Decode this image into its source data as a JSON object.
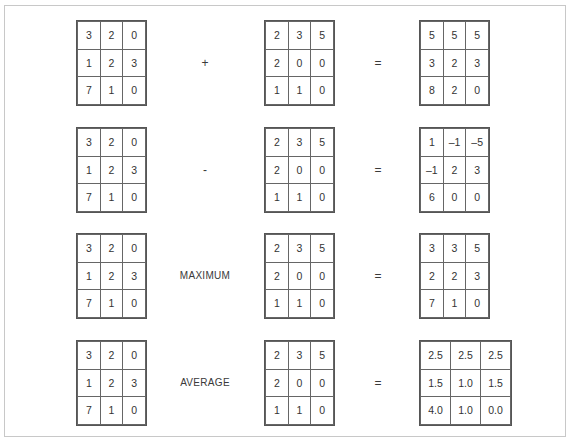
{
  "figure": {
    "title": "",
    "border_color": "#c8c8c8",
    "cell_border_color": "#666666",
    "text_color": "#333333"
  },
  "operations": [
    {
      "name": "addition",
      "operator_symbol": "+",
      "equals_symbol": "=",
      "operand_a": [
        [
          "3",
          "2",
          "0"
        ],
        [
          "1",
          "2",
          "3"
        ],
        [
          "7",
          "1",
          "0"
        ]
      ],
      "operand_b": [
        [
          "2",
          "3",
          "5"
        ],
        [
          "2",
          "0",
          "0"
        ],
        [
          "1",
          "1",
          "0"
        ]
      ],
      "result": [
        [
          "5",
          "5",
          "5"
        ],
        [
          "3",
          "2",
          "3"
        ],
        [
          "8",
          "2",
          "0"
        ]
      ]
    },
    {
      "name": "subtraction",
      "operator_symbol": "-",
      "equals_symbol": "=",
      "operand_a": [
        [
          "3",
          "2",
          "0"
        ],
        [
          "1",
          "2",
          "3"
        ],
        [
          "7",
          "1",
          "0"
        ]
      ],
      "operand_b": [
        [
          "2",
          "3",
          "5"
        ],
        [
          "2",
          "0",
          "0"
        ],
        [
          "1",
          "1",
          "0"
        ]
      ],
      "result": [
        [
          "1",
          "–1",
          "–5"
        ],
        [
          "–1",
          "2",
          "3"
        ],
        [
          "6",
          "0",
          "0"
        ]
      ]
    },
    {
      "name": "maximum",
      "operator_symbol": "MAXIMUM",
      "equals_symbol": "=",
      "operand_a": [
        [
          "3",
          "2",
          "0"
        ],
        [
          "1",
          "2",
          "3"
        ],
        [
          "7",
          "1",
          "0"
        ]
      ],
      "operand_b": [
        [
          "2",
          "3",
          "5"
        ],
        [
          "2",
          "0",
          "0"
        ],
        [
          "1",
          "1",
          "0"
        ]
      ],
      "result": [
        [
          "3",
          "3",
          "5"
        ],
        [
          "2",
          "2",
          "3"
        ],
        [
          "7",
          "1",
          "0"
        ]
      ]
    },
    {
      "name": "average",
      "operator_symbol": "AVERAGE",
      "equals_symbol": "=",
      "operand_a": [
        [
          "3",
          "2",
          "0"
        ],
        [
          "1",
          "2",
          "3"
        ],
        [
          "7",
          "1",
          "0"
        ]
      ],
      "operand_b": [
        [
          "2",
          "3",
          "5"
        ],
        [
          "2",
          "0",
          "0"
        ],
        [
          "1",
          "1",
          "0"
        ]
      ],
      "result": [
        [
          "2.5",
          "2.5",
          "2.5"
        ],
        [
          "1.5",
          "1.0",
          "1.5"
        ],
        [
          "4.0",
          "1.0",
          "0.0"
        ]
      ]
    }
  ]
}
